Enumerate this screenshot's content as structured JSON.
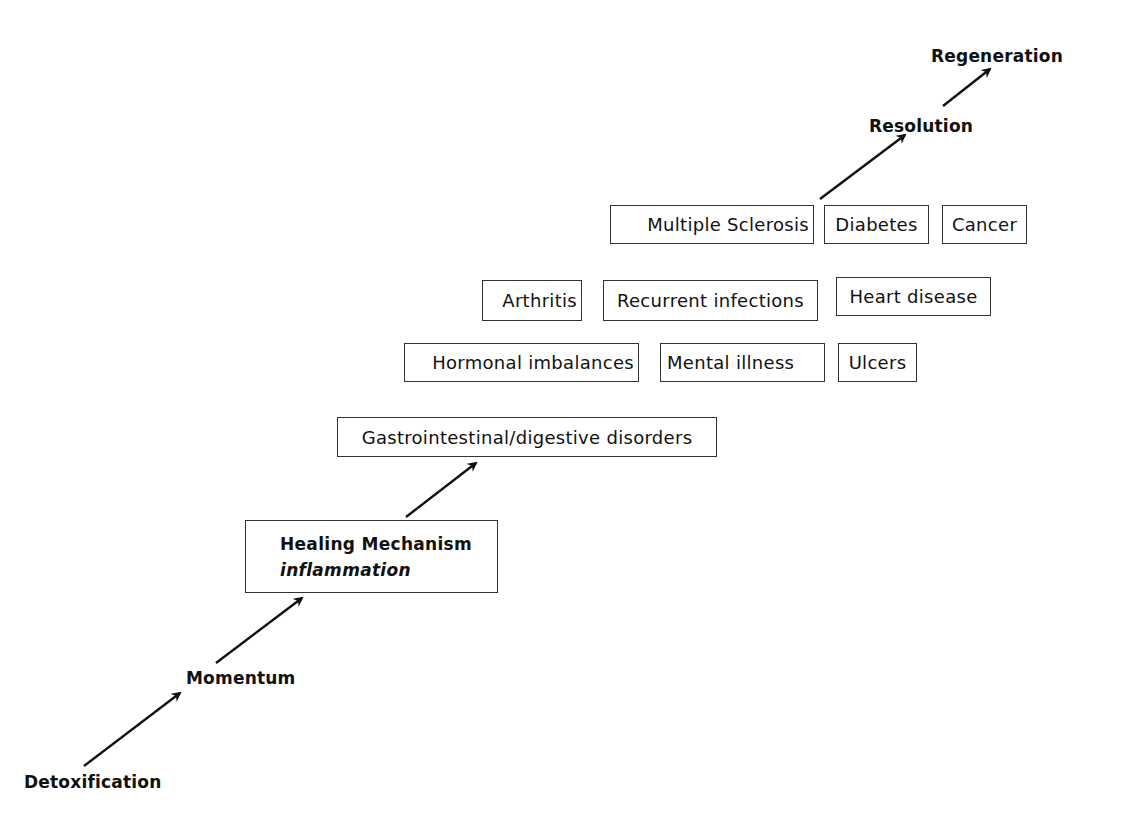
{
  "diagram": {
    "stages": {
      "detoxification": "Detoxification",
      "momentum": "Momentum",
      "resolution": "Resolution",
      "regeneration": "Regeneration"
    },
    "healing_mechanism": {
      "title": "Healing Mechanism",
      "subtitle": "inflammation"
    },
    "gastro_box": "Gastrointestinal/digestive disorders",
    "row1": [
      "Hormonal imbalances",
      "Mental illness",
      "Ulcers"
    ],
    "row2": [
      "Arthritis",
      "Recurrent infections",
      "Heart disease"
    ],
    "row3": [
      "Multiple Sclerosis",
      "Diabetes",
      "Cancer"
    ],
    "arrows": [
      {
        "from": "Detoxification",
        "to": "Momentum"
      },
      {
        "from": "Momentum",
        "to": "Healing Mechanism"
      },
      {
        "from": "Healing Mechanism",
        "to": "Gastrointestinal/digestive disorders"
      },
      {
        "from": "Multiple Sclerosis",
        "to": "Resolution"
      },
      {
        "from": "Resolution",
        "to": "Regeneration"
      }
    ],
    "colors": {
      "line": "#111111",
      "border": "#333333",
      "background": "#ffffff"
    }
  }
}
